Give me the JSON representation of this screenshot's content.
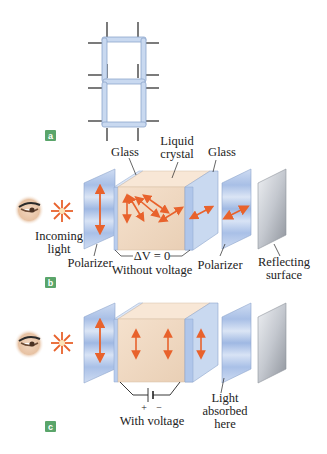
{
  "figure": {
    "panels": [
      {
        "id": "a",
        "badge": "a",
        "description": "Seven-segment display digit"
      },
      {
        "id": "b",
        "badge": "b",
        "caption": "Without voltage",
        "voltage_label": "ΔV = 0"
      },
      {
        "id": "c",
        "badge": "c",
        "caption": "With voltage",
        "battery_plus": "+",
        "battery_minus": "−"
      }
    ],
    "labels": {
      "glass_left": "Glass",
      "liquid_crystal_line1": "Liquid",
      "liquid_crystal_line2": "crystal",
      "glass_right": "Glass",
      "incoming_light_line1": "Incoming",
      "incoming_light_line2": "light",
      "polarizer_left": "Polarizer",
      "polarizer_right": "Polarizer",
      "reflecting_line1": "Reflecting",
      "reflecting_line2": "surface",
      "absorbed_line1": "Light",
      "absorbed_line2": "absorbed",
      "absorbed_line3": "here"
    },
    "colors": {
      "badge_green": "#5aa56a",
      "glass_blue": "#c9d9f0",
      "crystal_peach": "#f2dcc6",
      "arrow_orange": "#e8622c",
      "reflector_gray": "#b8bcc4"
    }
  }
}
